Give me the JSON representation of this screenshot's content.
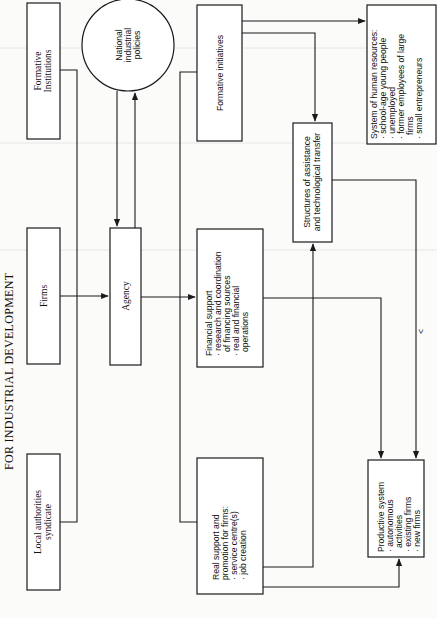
{
  "title": "FOR INDUSTRIAL DEVELOPMENT",
  "nodes": {
    "formative_institutions": {
      "lines": [
        "Formative",
        "Institutions"
      ]
    },
    "firms": {
      "lines": [
        "Firms"
      ]
    },
    "local_authorities": {
      "lines": [
        "Local authorities",
        "syndicate"
      ]
    },
    "national_policies": {
      "lines": [
        "National",
        "industrial",
        "policies"
      ]
    },
    "agency": {
      "lines": [
        "Agency"
      ]
    },
    "formative_initiatives": {
      "lines": [
        "Formative initiatives"
      ]
    },
    "financial_support": {
      "lines": [
        "Financial support",
        "· research and coordination",
        "of financing sources",
        "· real and financial",
        "operations"
      ]
    },
    "real_support": {
      "lines": [
        "Real support and",
        "promotion for firms:",
        "· service centre(s)",
        "· job creation"
      ]
    },
    "structures": {
      "lines": [
        "Structures of assistance",
        "and technological transfer"
      ]
    },
    "human_resources": {
      "lines": [
        "System of human resources:",
        "· school-age young people",
        "· unemployed",
        "· former employees of large",
        "firms",
        "· small entrepreneurs"
      ]
    },
    "productive_system": {
      "lines": [
        "Productive system",
        "· autonomous",
        "activities",
        "· existing firms",
        "· new firms"
      ]
    }
  },
  "annotations": {
    "chevron": "<"
  },
  "edges": [
    {
      "from": "formative_institutions",
      "to": "agency-bracket"
    },
    {
      "from": "firms",
      "to": "agency"
    },
    {
      "from": "local_authorities",
      "to": "agency-bracket"
    },
    {
      "from": "national_policies",
      "to": "agency"
    },
    {
      "from": "agency",
      "to": "national_policies"
    },
    {
      "from": "agency",
      "to": "financial_support"
    },
    {
      "from": "formative_initiatives",
      "to": "human_resources"
    },
    {
      "from": "formative_initiatives",
      "to": "structures"
    },
    {
      "from": "financial_support",
      "to": "productive_system"
    },
    {
      "from": "real_support",
      "to": "structures"
    },
    {
      "from": "real_support",
      "to": "productive_system"
    },
    {
      "from": "structures",
      "to": "productive_system"
    }
  ],
  "colors": {
    "ink": "#1a1a1a",
    "paper": "#fbfbfa"
  }
}
